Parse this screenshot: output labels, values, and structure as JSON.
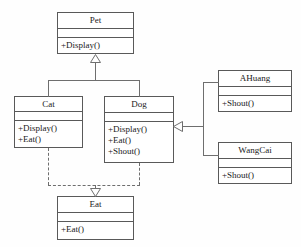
{
  "diagram": {
    "type": "uml-class-diagram",
    "background_color": "#fefefe",
    "line_color": "#6e6e6e",
    "border_color": "#595959",
    "text_color": "#1a1a1a"
  },
  "classes": {
    "pet": {
      "name": "Pet",
      "attributes": [],
      "operations": [
        "+Display()"
      ]
    },
    "cat": {
      "name": "Cat",
      "attributes": [],
      "operations": [
        "+Display()",
        "+Eat()"
      ]
    },
    "dog": {
      "name": "Dog",
      "attributes": [],
      "operations": [
        "+Display()",
        "+Eat()",
        "+Shout()"
      ]
    },
    "ahuang": {
      "name": "AHuang",
      "attributes": [],
      "operations": [
        "+Shout()"
      ]
    },
    "wangcai": {
      "name": "WangCai",
      "attributes": [],
      "operations": [
        "+Shout()"
      ]
    },
    "eat": {
      "name": "Eat",
      "attributes": [],
      "operations": [
        "+Eat()"
      ]
    }
  },
  "relationships": [
    {
      "id": "cat-pet",
      "kind": "generalization",
      "from": "Cat",
      "to": "Pet",
      "style": "solid"
    },
    {
      "id": "dog-pet",
      "kind": "generalization",
      "from": "Dog",
      "to": "Pet",
      "style": "solid"
    },
    {
      "id": "cat-eat",
      "kind": "realization",
      "from": "Cat",
      "to": "Eat",
      "style": "dashed"
    },
    {
      "id": "dog-eat",
      "kind": "realization",
      "from": "Dog",
      "to": "Eat",
      "style": "dashed"
    },
    {
      "id": "ahuang-dog",
      "kind": "generalization",
      "from": "AHuang",
      "to": "Dog",
      "style": "solid"
    },
    {
      "id": "wangcai-dog",
      "kind": "generalization",
      "from": "WangCai",
      "to": "Dog",
      "style": "solid"
    }
  ]
}
